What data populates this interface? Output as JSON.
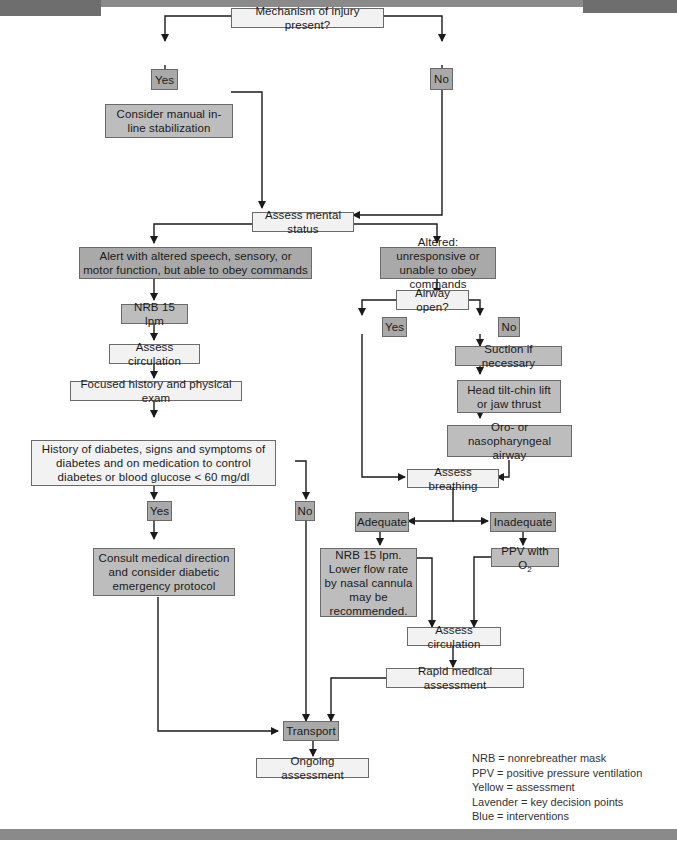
{
  "flowchart": {
    "nodes": {
      "mechanism": "Mechanism of injury present?",
      "moi_yes": "Yes",
      "moi_no": "No",
      "manual_stab": "Consider manual in-line stabilization",
      "mental_status": "Assess mental status",
      "alert_altered": "Alert with altered speech, sensory, or motor function, but able to obey commands",
      "nrb_left": "NRB 15 lpm",
      "circ_left": "Assess circulation",
      "focused_hx": "Focused history and physical exam",
      "diabetes_q": "History of diabetes, signs and symptoms of diabetes and on medication to control diabetes or blood glucose < 60 mg/dl",
      "diab_yes": "Yes",
      "diab_no": "No",
      "consult": "Consult medical direction and consider diabetic emergency protocol",
      "altered_unresp": "Altered: unresponsive or unable to obey commands",
      "airway_q": "Airway open?",
      "airway_yes": "Yes",
      "airway_no": "No",
      "suction": "Suction if necessary",
      "head_tilt": "Head tilt-chin lift or jaw thrust",
      "opa_npa": "Oro- or nasopharyngeal airway",
      "assess_breathing": "Assess breathing",
      "adequate": "Adequate",
      "inadequate": "Inadequate",
      "nrb_right": "NRB 15 lpm. Lower flow rate by nasal cannula may be recommended.",
      "ppv_text": "PPV with O",
      "ppv_sub": "2",
      "circ_right": "Assess circulation",
      "rapid_med": "Rapid medical assessment",
      "transport": "Transport",
      "ongoing": "Ongoing assessment"
    },
    "legend": [
      "NRB = nonrebreather mask",
      "PPV = positive pressure ventilation",
      "Yellow = assessment",
      "Lavender = key decision points",
      "Blue = interventions"
    ],
    "colors": {
      "assessment": "#f2f2f2",
      "decision": "#a9a9a9",
      "intervention": "#bdbdbd",
      "line": "#1a1a1a",
      "bar": "#8a8a8a"
    }
  }
}
